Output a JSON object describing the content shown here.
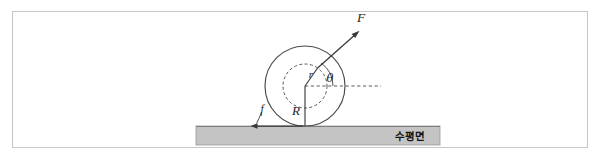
{
  "figure": {
    "frame": {
      "border_color": "#c9c9c9",
      "background": "#ffffff"
    },
    "labels": {
      "force": "F",
      "outer_radius": "R",
      "inner_radius": "r",
      "friction": "f",
      "angle": "θ",
      "surface": "수평면"
    },
    "colors": {
      "line": "#3a3a3a",
      "dashed": "#555555",
      "ground_fill": "#c4c4c4",
      "ground_stroke": "#9a9a9a",
      "frame": "#c9c9c9"
    },
    "geometry": {
      "center_x": 305,
      "center_y": 86,
      "outer_radius_px": 40,
      "inner_radius_px": 22,
      "ground_y": 126,
      "ground_left": 196,
      "ground_right": 440,
      "ground_height": 19,
      "force_angle_deg": 55,
      "force_tip_x": 358,
      "force_tip_y": 32,
      "reference_line_end_x": 381
    }
  }
}
